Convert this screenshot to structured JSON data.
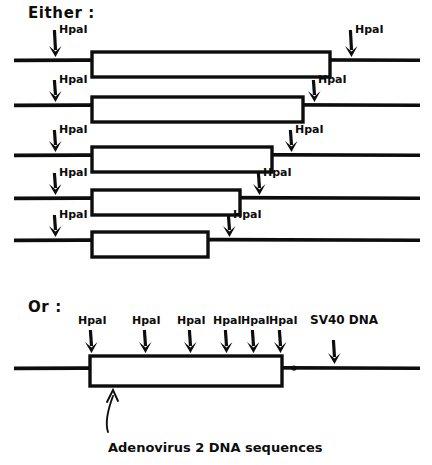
{
  "figure": {
    "ink_color": "#0d0d0d",
    "paper_color": "#ffffff"
  },
  "headings": {
    "either": "Either :",
    "or": "Or :"
  },
  "labels": {
    "enzyme": "HpaI",
    "sv40": "SV40 DNA",
    "caption": "Adenovirus 2 DNA sequences"
  },
  "either_rows": [
    {
      "id": "row-1",
      "line_y": 60,
      "line_x1": 14,
      "line_x2": 420,
      "box_x1": 92,
      "box_x2": 330,
      "box_y1": 52,
      "box_y2": 77,
      "arrows": [
        {
          "id": "left",
          "x": 55,
          "y_tip": 57,
          "y_top": 30,
          "label": "HpaI",
          "label_x": 59,
          "label_y": 33
        },
        {
          "id": "right",
          "x": 351,
          "y_tip": 57,
          "y_top": 30,
          "label": "HpaI",
          "label_x": 355,
          "label_y": 33
        }
      ]
    },
    {
      "id": "row-2",
      "line_y": 105,
      "line_x1": 14,
      "line_x2": 420,
      "box_x1": 92,
      "box_x2": 303,
      "box_y1": 97,
      "box_y2": 122,
      "arrows": [
        {
          "id": "left",
          "x": 55,
          "y_tip": 102,
          "y_top": 80,
          "label": "HpaI",
          "label_x": 59,
          "label_y": 83
        },
        {
          "id": "right",
          "x": 314,
          "y_tip": 102,
          "y_top": 80,
          "label": "HpaI",
          "label_x": 318,
          "label_y": 83
        }
      ]
    },
    {
      "id": "row-3",
      "line_y": 155,
      "line_x1": 14,
      "line_x2": 420,
      "box_x1": 92,
      "box_x2": 272,
      "box_y1": 147,
      "box_y2": 172,
      "arrows": [
        {
          "id": "left",
          "x": 55,
          "y_tip": 152,
          "y_top": 130,
          "label": "HpaI",
          "label_x": 59,
          "label_y": 133
        },
        {
          "id": "right",
          "x": 291,
          "y_tip": 152,
          "y_top": 130,
          "label": "HpaI",
          "label_x": 295,
          "label_y": 133
        }
      ]
    },
    {
      "id": "row-4",
      "line_y": 198,
      "line_x1": 14,
      "line_x2": 420,
      "box_x1": 92,
      "box_x2": 240,
      "box_y1": 190,
      "box_y2": 215,
      "arrows": [
        {
          "id": "left",
          "x": 55,
          "y_tip": 195,
          "y_top": 173,
          "label": "HpaI",
          "label_x": 59,
          "label_y": 176
        },
        {
          "id": "right",
          "x": 259,
          "y_tip": 195,
          "y_top": 173,
          "label": "HpaI",
          "label_x": 263,
          "label_y": 176
        }
      ]
    },
    {
      "id": "row-5",
      "line_y": 240,
      "line_x1": 14,
      "line_x2": 420,
      "box_x1": 92,
      "box_x2": 208,
      "box_y1": 232,
      "box_y2": 257,
      "arrows": [
        {
          "id": "left",
          "x": 55,
          "y_tip": 237,
          "y_top": 215,
          "label": "HpaI",
          "label_x": 59,
          "label_y": 218
        },
        {
          "id": "right",
          "x": 229,
          "y_tip": 237,
          "y_top": 215,
          "label": "HpaI",
          "label_x": 233,
          "label_y": 218
        }
      ]
    }
  ],
  "or_row": {
    "id": "row-or",
    "line_y": 368,
    "line_x1": 14,
    "line_x2": 420,
    "box_x1": 90,
    "box_x2": 282,
    "box_y1": 356,
    "box_y2": 386,
    "dot_x": 294,
    "arrows": [
      {
        "id": "hpa-1",
        "x": 91,
        "y_tip": 353,
        "y_top": 330,
        "label": "HpaI",
        "label_x": 78,
        "label_y": 324
      },
      {
        "id": "hpa-2",
        "x": 145,
        "y_tip": 353,
        "y_top": 330,
        "label": "HpaI",
        "label_x": 132,
        "label_y": 324
      },
      {
        "id": "hpa-3",
        "x": 190,
        "y_tip": 353,
        "y_top": 330,
        "label": "HpaI",
        "label_x": 177,
        "label_y": 324
      },
      {
        "id": "hpa-4",
        "x": 226,
        "y_tip": 353,
        "y_top": 330,
        "label": "HpaI",
        "label_x": 213,
        "label_y": 324
      },
      {
        "id": "hpa-5",
        "x": 253,
        "y_tip": 353,
        "y_top": 330,
        "label": "HpaI",
        "label_x": 241,
        "label_y": 324
      },
      {
        "id": "hpa-6",
        "x": 280,
        "y_tip": 353,
        "y_top": 330,
        "label": "HpaI",
        "label_x": 269,
        "label_y": 324
      },
      {
        "id": "sv40",
        "x": 334,
        "y_tip": 364,
        "y_top": 340,
        "label": "SV40 DNA",
        "label_x": 310,
        "label_y": 324
      }
    ],
    "caption_pointer": {
      "tip_x": 112,
      "tip_y": 390,
      "bend_x": 104,
      "bend_y": 420,
      "tail_x": 108,
      "tail_y": 432
    },
    "caption_x": 108,
    "caption_y": 452
  }
}
